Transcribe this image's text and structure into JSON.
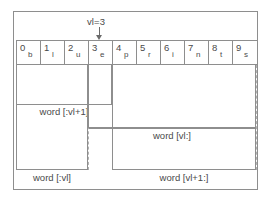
{
  "diagram": {
    "marker": {
      "label": "vl=3",
      "arrow_icon": "arrow-down-icon",
      "index": 3
    },
    "string": {
      "value": "blueprints",
      "cells": [
        {
          "index": "0",
          "char": "b"
        },
        {
          "index": "1",
          "char": "l"
        },
        {
          "index": "2",
          "char": "u"
        },
        {
          "index": "3",
          "char": "e"
        },
        {
          "index": "4",
          "char": "p"
        },
        {
          "index": "5",
          "char": "r"
        },
        {
          "index": "6",
          "char": "i"
        },
        {
          "index": "7",
          "char": "n"
        },
        {
          "index": "8",
          "char": "t"
        },
        {
          "index": "9",
          "char": "s"
        }
      ]
    },
    "slices": {
      "head_inclusive": "word [:vl+1]",
      "tail_inclusive": "word [vl:]",
      "head_exclusive": "word [:vl]",
      "tail_exclusive": "word [vl+1:]"
    },
    "colors": {
      "line": "#8e8e8e",
      "guide": "#b0b0b0",
      "text": "#4a4a4a",
      "background": "#ffffff"
    }
  }
}
